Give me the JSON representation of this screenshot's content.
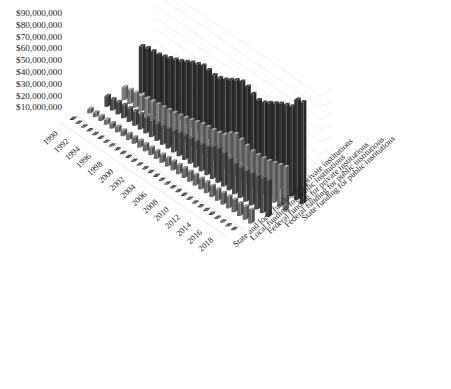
{
  "chart_data": {
    "type": "bar",
    "subtype": "3d-grouped-bar",
    "title": "",
    "xlabel": "",
    "ylabel": "",
    "zlabel": "",
    "ylim": [
      0,
      90000000
    ],
    "grid": true,
    "legend_position": "none",
    "y_tick_labels": [
      "$90,000,000",
      "$80,000,000",
      "$70,000,000",
      "$60,000,000",
      "$50,000,000",
      "$40,000,000",
      "$30,000,000",
      "$20,000,000",
      "$10,000,000"
    ],
    "y_tick_values": [
      90000000,
      80000000,
      70000000,
      60000000,
      50000000,
      40000000,
      30000000,
      20000000,
      10000000
    ],
    "categories": [
      "1990",
      "1991",
      "1992",
      "1993",
      "1994",
      "1995",
      "1996",
      "1997",
      "1998",
      "1999",
      "2000",
      "2001",
      "2002",
      "2003",
      "2004",
      "2005",
      "2006",
      "2007",
      "2008",
      "2009",
      "2010",
      "2011",
      "2012",
      "2013",
      "2014",
      "2015",
      "2016",
      "2017",
      "2018",
      "2019"
    ],
    "x_tick_labels": [
      "1990",
      "1992",
      "1994",
      "1996",
      "1998",
      "2000",
      "2002",
      "2004",
      "2006",
      "2008",
      "2010",
      "2012",
      "2014",
      "2016",
      "2018"
    ],
    "series": [
      {
        "name": "State and local funding for private institutions",
        "color": "#3f3f3f",
        "depth_index": 0,
        "values": [
          180000,
          190000,
          200000,
          210000,
          215000,
          225000,
          235000,
          245000,
          255000,
          265000,
          280000,
          290000,
          300000,
          315000,
          330000,
          345000,
          360000,
          380000,
          400000,
          415000,
          430000,
          445000,
          460000,
          480000,
          500000,
          520000,
          545000,
          570000,
          600000,
          630000
        ]
      },
      {
        "name": "Local funding for public institutions",
        "color": "#6b6b6b",
        "depth_index": 1,
        "values": [
          3600000,
          3800000,
          4000000,
          4200000,
          4400000,
          4600000,
          4800000,
          5000000,
          5300000,
          5600000,
          5900000,
          6200000,
          6500000,
          6800000,
          7100000,
          7400000,
          7700000,
          8100000,
          8500000,
          8800000,
          9000000,
          9100000,
          9200000,
          9400000,
          9700000,
          10000000,
          10400000,
          10800000,
          11200000,
          11600000
        ]
      },
      {
        "name": "Federal funding for private institutions",
        "color": "#4a4a4a",
        "depth_index": 2,
        "values": [
          9000000,
          9600000,
          10300000,
          11000000,
          11600000,
          12200000,
          12800000,
          13500000,
          14300000,
          15000000,
          15800000,
          16800000,
          18000000,
          19500000,
          20800000,
          21500000,
          22000000,
          22600000,
          24000000,
          27000000,
          29000000,
          28000000,
          26500000,
          25500000,
          25500000,
          26000000,
          27000000,
          28000000,
          29500000,
          31000000
        ]
      },
      {
        "name": "Federal funding for public institutions",
        "color": "#7a7a7a",
        "depth_index": 3,
        "values": [
          11000000,
          11800000,
          12600000,
          13400000,
          14100000,
          14800000,
          15500000,
          16300000,
          17200000,
          18100000,
          19000000,
          20200000,
          21600000,
          23200000,
          24600000,
          25400000,
          26000000,
          26800000,
          28500000,
          33000000,
          35500000,
          34000000,
          32000000,
          30500000,
          30500000,
          31000000,
          32000000,
          33500000,
          35000000,
          36500000
        ]
      },
      {
        "name": "State funding for public institutions",
        "color": "#333333",
        "depth_index": 4,
        "values": [
          40000000,
          41500000,
          42000000,
          42500000,
          44000000,
          46000000,
          48000000,
          50000000,
          52500000,
          55000000,
          57000000,
          59000000,
          58500000,
          57500000,
          58000000,
          60000000,
          63000000,
          66000000,
          68000000,
          67000000,
          64000000,
          62000000,
          63000000,
          66000000,
          69000000,
          72000000,
          74000000,
          76000000,
          85000000,
          86000000
        ]
      }
    ]
  }
}
